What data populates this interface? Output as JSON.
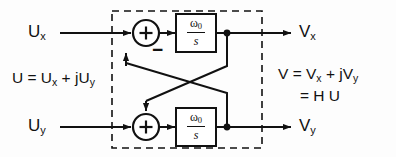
{
  "diagram": {
    "stroke_color": "#111111",
    "background_color": "#fdfdfd",
    "dashed_box": {
      "label": "system-boundary",
      "x": 112,
      "y": 11,
      "width": 150,
      "height": 137,
      "dash": "7 5"
    },
    "inputs": [
      {
        "name": "input-ux",
        "base": "U",
        "sub": "x"
      },
      {
        "name": "input-uy",
        "base": "U",
        "sub": "y"
      }
    ],
    "outputs": [
      {
        "name": "output-vx",
        "base": "V",
        "sub": "x"
      },
      {
        "name": "output-vy",
        "base": "V",
        "sub": "y"
      }
    ],
    "summers": [
      {
        "name": "summer-top",
        "symbol": "+",
        "extra_sign": "−",
        "cx": 146,
        "cy": 33,
        "r": 13
      },
      {
        "name": "summer-bottom",
        "symbol": "+",
        "extra_sign": "",
        "cx": 146,
        "cy": 127,
        "r": 13
      }
    ],
    "transfer_blocks": [
      {
        "name": "transfer-function-top",
        "numerator": "ω",
        "numerator_sub": "0",
        "denominator": "s"
      },
      {
        "name": "transfer-function-bottom",
        "numerator": "ω",
        "numerator_sub": "0",
        "denominator": "s"
      }
    ],
    "equations": {
      "left": {
        "name": "input-equation",
        "lines": [
          {
            "text": "U = U",
            "sub": "x",
            "tail": " + jU",
            "sub2": "y"
          }
        ],
        "plain": "U = Ux + jUy"
      },
      "right": {
        "name": "output-equation",
        "line1": {
          "text": "V = V",
          "sub": "x",
          "tail": " + jV",
          "sub2": "y"
        },
        "line2": "= H U",
        "plain": "V = Vx + jVy = H U"
      }
    },
    "node_dots": [
      {
        "name": "tap-node-top",
        "cx": 227,
        "cy": 33
      },
      {
        "name": "tap-node-bottom",
        "cx": 227,
        "cy": 127
      }
    ]
  }
}
